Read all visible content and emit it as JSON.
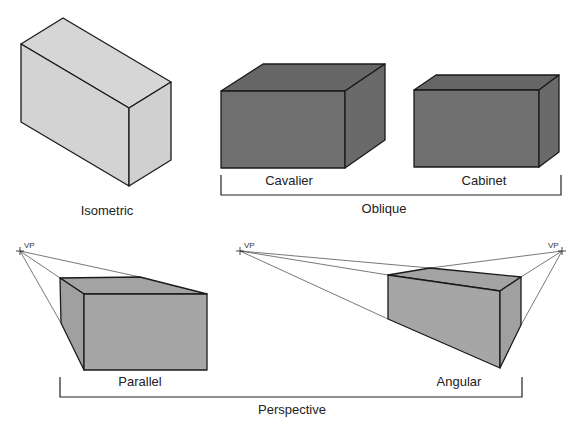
{
  "diagram": {
    "colors": {
      "isometric_fill": "#d3d3d3",
      "oblique_fill": "#6f6f6f",
      "oblique_top": "#666666",
      "perspective_fill": "#a6a6a6",
      "outline": "#1a1a1a",
      "projector": "#555555"
    },
    "labels": {
      "isometric": "Isometric",
      "cavalier": "Cavalier",
      "cabinet": "Cabinet",
      "oblique": "Oblique",
      "parallel": "Parallel",
      "angular": "Angular",
      "perspective": "Perspective",
      "vp_left_parallel": "VP",
      "vp_left_angular": "VP",
      "vp_right_angular": "VP"
    },
    "groups": [
      {
        "name": "Oblique",
        "members": [
          "Cavalier",
          "Cabinet"
        ]
      },
      {
        "name": "Perspective",
        "members": [
          "Parallel",
          "Angular"
        ]
      }
    ]
  }
}
